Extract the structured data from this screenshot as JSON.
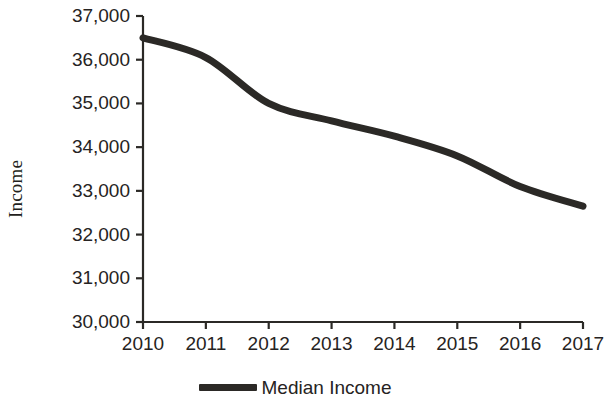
{
  "chart_data": {
    "type": "line",
    "title": "",
    "xlabel": "",
    "ylabel": "Income",
    "x": [
      2010,
      2011,
      2012,
      2013,
      2014,
      2015,
      2016,
      2017
    ],
    "xtick_labels": [
      "2010",
      "2011",
      "2012",
      "2013",
      "2014",
      "2015",
      "2016",
      "2017"
    ],
    "ytick_labels": [
      "37,000",
      "36,000",
      "35,000",
      "34,000",
      "33,000",
      "32,000",
      "31,000",
      "30,000"
    ],
    "ytick_values": [
      37000,
      36000,
      35000,
      34000,
      33000,
      32000,
      31000,
      30000
    ],
    "ylim": [
      30000,
      37000
    ],
    "xlim": [
      2010,
      2017
    ],
    "grid": false,
    "legend_position": "bottom-center",
    "series": [
      {
        "name": "Median Income",
        "color": "#2b2926",
        "line_width": 7,
        "values": [
          36500,
          36050,
          35000,
          34600,
          34250,
          33800,
          33100,
          32650
        ]
      }
    ]
  },
  "legend": {
    "entries": [
      {
        "label": "Median Income",
        "swatch": "line-swatch"
      }
    ]
  },
  "axes": {
    "y_title": "Income",
    "axis_color": "#2b2926"
  }
}
